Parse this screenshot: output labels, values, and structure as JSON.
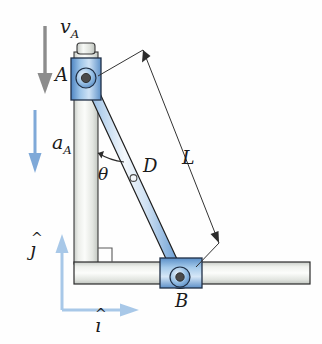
{
  "figure": {
    "type": "engineering-mechanism-diagram",
    "background_color": "#fefefe"
  },
  "labels": {
    "velocity_A": "v",
    "velocity_A_sub": "A",
    "acceleration_A": "a",
    "acceleration_A_sub": "A",
    "point_A": "A",
    "point_B": "B",
    "point_D": "D",
    "length_L": "L",
    "angle_theta": "θ",
    "unit_vector_i": "ı",
    "unit_vector_i_hat": "^",
    "unit_vector_j": "ȷ",
    "unit_vector_j_hat": "^"
  },
  "colors": {
    "velocity_arrow": "#8c8c8c",
    "acceleration_arrow": "#7fa9d8",
    "axis_arrow": "#a8c8e8",
    "collar_fill_dark": "#5b8fc9",
    "collar_fill_light": "#cfe2f5",
    "rod_fill_light": "#eef4fb",
    "rod_fill_blue": "#7ba9d9",
    "guide_fill": "#f2f3f1",
    "guide_edge": "#9aa09a",
    "outline": "#1f1f1f",
    "pin_fill": "#4a4a4a",
    "dimension_line": "#3a3a3a"
  },
  "geometry": {
    "point_A": {
      "x": 86,
      "y": 78
    },
    "point_B": {
      "x": 180,
      "y": 277
    },
    "point_D": {
      "x": 133,
      "y": 178
    },
    "angle_theta_deg": 25,
    "vertical_guide": {
      "x": 74,
      "y_top": 46,
      "width": 24,
      "y_bottom": 262
    },
    "horizontal_guide": {
      "x_left": 74,
      "y": 262,
      "x_right": 310,
      "height": 22
    }
  }
}
